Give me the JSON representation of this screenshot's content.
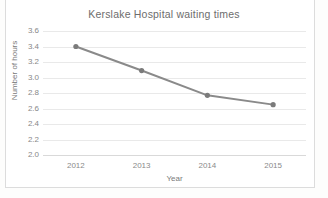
{
  "chart_data": {
    "type": "line",
    "title": "Kerslake Hospital waiting times",
    "xlabel": "Year",
    "ylabel": "Number of hours",
    "categories": [
      "2012",
      "2013",
      "2014",
      "2015"
    ],
    "values": [
      3.4,
      3.09,
      2.77,
      2.65
    ],
    "series": [
      {
        "name": "waiting time",
        "values": [
          3.4,
          3.09,
          2.77,
          2.65
        ]
      }
    ],
    "ylim": [
      2.0,
      3.6
    ],
    "yticks": [
      "3.6",
      "3.4",
      "3.2",
      "3.0",
      "2.8",
      "2.6",
      "2.4",
      "2.2",
      "2.0"
    ],
    "ytick_values": [
      3.6,
      3.4,
      3.2,
      3.0,
      2.8,
      2.6,
      2.4,
      2.2,
      2.0
    ],
    "grid": true,
    "legend": false,
    "legend_position": "none",
    "line_color": "#8a8a8a",
    "marker_color": "#7b7b7b",
    "grid_color": "#e9e9e9",
    "text_color": "#7a7a7a"
  }
}
